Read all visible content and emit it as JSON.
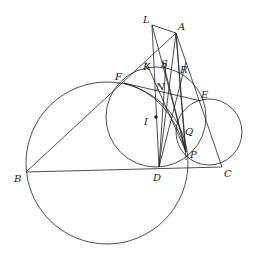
{
  "diagram": {
    "type": "geometry",
    "points": {
      "L": {
        "label": "L",
        "x": 152,
        "y": 25
      },
      "A": {
        "label": "A",
        "x": 176,
        "y": 33
      },
      "B": {
        "label": "B",
        "x": 26,
        "y": 172
      },
      "C": {
        "label": "C",
        "x": 222,
        "y": 167
      },
      "D": {
        "label": "D",
        "x": 159,
        "y": 167
      },
      "E": {
        "label": "E",
        "x": 201,
        "y": 101
      },
      "F": {
        "label": "F",
        "x": 124,
        "y": 83
      },
      "I": {
        "label": "I",
        "x": 156,
        "y": 117
      },
      "K": {
        "label": "K",
        "x": 148,
        "y": 73
      },
      "S": {
        "label": "S",
        "x": 164,
        "y": 70
      },
      "R": {
        "label": "R",
        "x": 183,
        "y": 76
      },
      "N": {
        "label": "N",
        "x": 163,
        "y": 91
      },
      "Q": {
        "label": "Q",
        "x": 186,
        "y": 130
      },
      "P": {
        "label": "P",
        "x": 186,
        "y": 152
      }
    },
    "labels": {
      "L": "L",
      "A": "A",
      "B": "B",
      "C": "C",
      "D": "D",
      "E": "E",
      "F": "F",
      "I": "I",
      "K": "K",
      "S": "S",
      "R": "R",
      "N": "N",
      "Q": "Q",
      "P": "P"
    },
    "circles": [
      {
        "name": "incircle",
        "center": "I",
        "cx": 156,
        "cy": 117,
        "r": 50
      },
      {
        "name": "circle-BFP",
        "cx": 107,
        "cy": 163,
        "r": 81
      },
      {
        "name": "circle-EPC",
        "cx": 209,
        "cy": 132,
        "r": 33
      }
    ],
    "segments": [
      [
        "L",
        "A"
      ],
      [
        "A",
        "B"
      ],
      [
        "A",
        "C"
      ],
      [
        "B",
        "C"
      ],
      [
        "L",
        "D"
      ],
      [
        "A",
        "D"
      ],
      [
        "L",
        "P"
      ],
      [
        "A",
        "P"
      ],
      [
        "F",
        "E"
      ],
      [
        "F",
        "P"
      ],
      [
        "D",
        "S"
      ],
      [
        "D",
        "R"
      ],
      [
        "K",
        "P"
      ],
      [
        "I",
        "D"
      ]
    ]
  }
}
